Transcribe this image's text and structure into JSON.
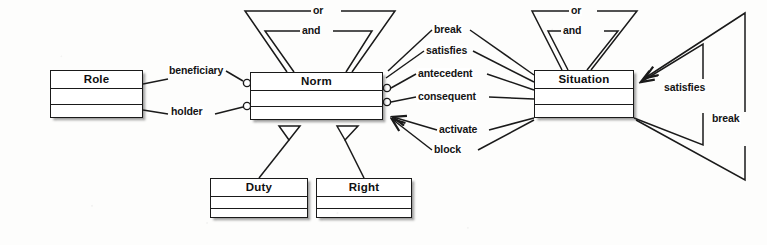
{
  "diagram": {
    "type": "uml-class-diagram",
    "background_color": "#fdfdfc",
    "line_color": "#1a1a1a",
    "text_color": "#101010",
    "classes": [
      {
        "id": "role",
        "name": "Role",
        "x": 50,
        "y": 70,
        "width": 93,
        "height": 48
      },
      {
        "id": "norm",
        "name": "Norm",
        "x": 250,
        "y": 72,
        "width": 133,
        "height": 48
      },
      {
        "id": "situation",
        "name": "Situation",
        "x": 534,
        "y": 70,
        "width": 100,
        "height": 48
      },
      {
        "id": "duty",
        "name": "Duty",
        "x": 210,
        "y": 178,
        "width": 98,
        "height": 40
      },
      {
        "id": "right",
        "name": "Right",
        "x": 316,
        "y": 178,
        "width": 96,
        "height": 40
      }
    ],
    "associations": [
      {
        "id": "beneficiary",
        "label": "beneficiary",
        "from": "role",
        "to": "norm",
        "end": "aggregation"
      },
      {
        "id": "holder",
        "label": "holder",
        "from": "role",
        "to": "norm",
        "end": "aggregation"
      },
      {
        "id": "break",
        "label": "break",
        "from": "norm",
        "to": "situation",
        "end": "plain"
      },
      {
        "id": "satisfies",
        "label": "satisfies",
        "from": "norm",
        "to": "situation",
        "end": "plain"
      },
      {
        "id": "antecedent",
        "label": "antecedent",
        "from": "norm",
        "to": "situation",
        "end": "aggregation"
      },
      {
        "id": "consequent",
        "label": "consequent",
        "from": "norm",
        "to": "situation",
        "end": "aggregation"
      },
      {
        "id": "activate",
        "label": "activate",
        "from": "situation",
        "to": "norm",
        "end": "arrow"
      },
      {
        "id": "block",
        "label": "block",
        "from": "situation",
        "to": "norm",
        "end": "arrow"
      }
    ],
    "self_associations": [
      {
        "id": "norm-or",
        "label": "or",
        "on": "norm",
        "position": "top",
        "nesting": "outer"
      },
      {
        "id": "norm-and",
        "label": "and",
        "on": "norm",
        "position": "top",
        "nesting": "inner"
      },
      {
        "id": "situation-or",
        "label": "or",
        "on": "situation",
        "position": "top",
        "nesting": "outer"
      },
      {
        "id": "situation-and",
        "label": "and",
        "on": "situation",
        "position": "top",
        "nesting": "inner"
      },
      {
        "id": "situation-satisfies",
        "label": "satisfies",
        "on": "situation",
        "position": "right",
        "nesting": "inner"
      },
      {
        "id": "situation-break",
        "label": "break",
        "on": "situation",
        "position": "right",
        "nesting": "outer"
      }
    ],
    "generalizations": [
      {
        "id": "duty-norm",
        "from": "duty",
        "to": "norm",
        "marker": "hollow-triangle"
      },
      {
        "id": "right-norm",
        "from": "right",
        "to": "norm",
        "marker": "hollow-triangle"
      }
    ],
    "labels": {
      "role": "Role",
      "norm": "Norm",
      "situation": "Situation",
      "duty": "Duty",
      "right": "Right",
      "beneficiary": "beneficiary",
      "holder": "holder",
      "break": "break",
      "satisfies": "satisfies",
      "antecedent": "antecedent",
      "consequent": "consequent",
      "activate": "activate",
      "block": "block",
      "or": "or",
      "and": "and",
      "situation_satisfies": "satisfies",
      "situation_break": "break",
      "norm_or": "or",
      "norm_and": "and",
      "situation_or": "or",
      "situation_and": "and"
    }
  }
}
